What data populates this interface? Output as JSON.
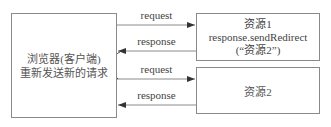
{
  "client_box": {
    "line1": "浏览器(客户端)",
    "line2": "重新发送新的请求"
  },
  "resource1_box": {
    "title": "资源1",
    "line2": "response.sendRedirect",
    "line3": "(“资源2”)"
  },
  "resource2_box": {
    "title": "资源2"
  },
  "arrows": [
    {
      "label": "request",
      "direction": "to-resource1"
    },
    {
      "label": "response",
      "direction": "to-client"
    },
    {
      "label": "request",
      "direction": "to-resource2"
    },
    {
      "label": "response",
      "direction": "to-client"
    }
  ],
  "colors": {
    "line": "#8a8a8a",
    "arrowhead": "#333333",
    "text": "#444444"
  }
}
